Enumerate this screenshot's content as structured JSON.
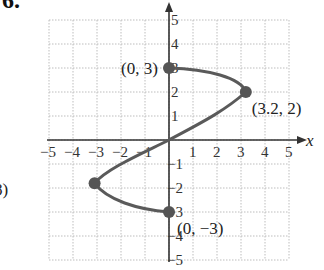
{
  "problem_number": "6.",
  "chart_data": {
    "type": "line",
    "title": "",
    "xlabel": "x",
    "ylabel": "",
    "xlim": [
      -5,
      5
    ],
    "ylim": [
      -5,
      5
    ],
    "grid": true,
    "x_ticks": [
      "-5",
      "-4",
      "-3",
      "-2",
      "-1",
      "1",
      "2",
      "3",
      "4",
      "5"
    ],
    "y_ticks": [
      "5",
      "4",
      "3",
      "2",
      "1",
      "-1",
      "-2",
      "-3",
      "-4",
      "-5"
    ],
    "curve": {
      "description": "smooth curve through labeled points",
      "points": [
        [
          0,
          3
        ],
        [
          3.2,
          2
        ],
        [
          0,
          0
        ],
        [
          -3.1,
          -1.8
        ],
        [
          0,
          -3
        ]
      ]
    },
    "points": [
      {
        "x": 0,
        "y": 3,
        "label": "(0, 3)"
      },
      {
        "x": 3.2,
        "y": 2,
        "label": "(3.2,  2)"
      },
      {
        "x": -3.1,
        "y": -1.8,
        "label": "(−3.1, −1.8)"
      },
      {
        "x": 0,
        "y": -3,
        "label": "(0, −3)"
      }
    ]
  },
  "colors": {
    "curve": "#5a5a5a",
    "grid": "#bdbdbd",
    "axis": "#333333"
  }
}
